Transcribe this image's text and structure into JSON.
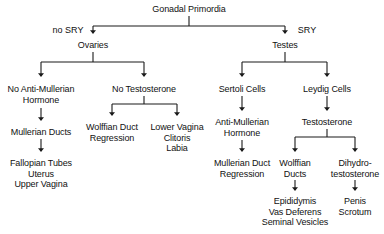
{
  "meta": {
    "type": "flowchart",
    "orientation": "top-down",
    "line_color": "#1a1a1a",
    "text_color": "#111111",
    "background_color": "#ffffff"
  },
  "nodes": {
    "gonadal_primordia": "Gonadal Primordia",
    "ovaries": "Ovaries",
    "testes": "Testes",
    "no_amh": "No Anti-Mullerian\nHormone",
    "no_testosterone": "No Testosterone",
    "sertoli_cells": "Sertoli Cells",
    "leydig_cells": "Leydig Cells",
    "mullerian_ducts": "Mullerian Ducts",
    "wolffian_duct_regression": "Wolffian Duct\nRegression",
    "lower_vagina": "Lower Vagina\nClitoris\nLabia",
    "amh": "Anti-Mullerian\nHormone",
    "testosterone": "Testosterone",
    "fallopian_tubes": "Fallopian Tubes\nUterus\nUpper Vagina",
    "mullerian_duct_regression": "Mullerian Duct\nRegression",
    "wolffian_ducts": "Wolffian\nDucts",
    "dihydrotestosterone": "Dihydro-\ntestosterone",
    "epididymis": "Epididymis\nVas Deferens\nSeminal Vesicles",
    "penis_scrotum": "Penis\nScrotum"
  },
  "edge_labels": {
    "no_sry": "no SRY",
    "sry": "SRY"
  },
  "layout": {
    "gonadal_primordia": {
      "x": 189,
      "y": 4
    },
    "no_sry_label": {
      "x": 68,
      "y": 25
    },
    "sry_label": {
      "x": 307,
      "y": 25
    },
    "ovaries": {
      "x": 93,
      "y": 40
    },
    "testes": {
      "x": 285,
      "y": 40
    },
    "no_amh": {
      "x": 41,
      "y": 84
    },
    "no_testosterone": {
      "x": 144,
      "y": 84
    },
    "sertoli_cells": {
      "x": 242,
      "y": 84
    },
    "leydig_cells": {
      "x": 327,
      "y": 84
    },
    "mullerian_ducts": {
      "x": 41,
      "y": 127
    },
    "wolffian_duct_regression": {
      "x": 112,
      "y": 122
    },
    "lower_vagina": {
      "x": 177,
      "y": 122
    },
    "amh": {
      "x": 242,
      "y": 117
    },
    "testosterone": {
      "x": 327,
      "y": 117
    },
    "fallopian_tubes": {
      "x": 41,
      "y": 158
    },
    "mullerian_duct_regression": {
      "x": 242,
      "y": 158
    },
    "wolffian_ducts": {
      "x": 295,
      "y": 158
    },
    "dihydrotestosterone": {
      "x": 355,
      "y": 158
    },
    "epididymis": {
      "x": 295,
      "y": 196
    },
    "penis_scrotum": {
      "x": 355,
      "y": 196
    }
  },
  "chart_data": {
    "type": "tree",
    "root": "Gonadal Primordia",
    "branches": [
      {
        "label": "no SRY",
        "node": "Ovaries",
        "children": [
          {
            "node": "No Anti-Mullerian Hormone",
            "children": [
              {
                "node": "Mullerian Ducts",
                "children": [
                  {
                    "node": "Fallopian Tubes / Uterus / Upper Vagina",
                    "children": []
                  }
                ]
              }
            ]
          },
          {
            "node": "No Testosterone",
            "children": [
              {
                "node": "Wolffian Duct Regression",
                "children": []
              },
              {
                "node": "Lower Vagina / Clitoris / Labia",
                "children": []
              }
            ]
          }
        ]
      },
      {
        "label": "SRY",
        "node": "Testes",
        "children": [
          {
            "node": "Sertoli Cells",
            "children": [
              {
                "node": "Anti-Mullerian Hormone",
                "children": [
                  {
                    "node": "Mullerian Duct Regression",
                    "children": []
                  }
                ]
              }
            ]
          },
          {
            "node": "Leydig Cells",
            "children": [
              {
                "node": "Testosterone",
                "children": [
                  {
                    "node": "Wolffian Ducts",
                    "children": [
                      {
                        "node": "Epididymis / Vas Deferens / Seminal Vesicles",
                        "children": []
                      }
                    ]
                  },
                  {
                    "node": "Dihydro-testosterone",
                    "children": [
                      {
                        "node": "Penis / Scrotum",
                        "children": []
                      }
                    ]
                  }
                ]
              }
            ]
          }
        ]
      }
    ]
  }
}
